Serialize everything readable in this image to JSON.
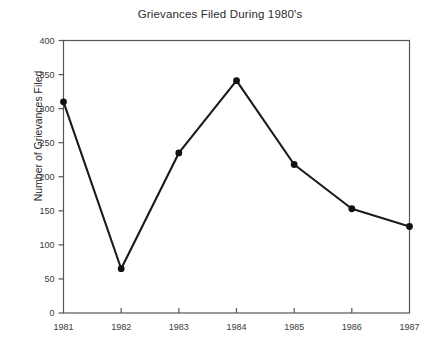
{
  "chart_data": {
    "type": "line",
    "title": "Grievances Filed During 1980's",
    "xlabel": "",
    "ylabel": "Number of Grievances Filed",
    "categories": [
      "1981",
      "1982",
      "1983",
      "1984",
      "1985",
      "1986",
      "1987"
    ],
    "values": [
      310,
      65,
      235,
      341,
      218,
      153,
      127
    ],
    "x": [
      1981,
      1982,
      1983,
      1984,
      1985,
      1986,
      1987
    ],
    "xlim": [
      1981,
      1987
    ],
    "ylim": [
      0,
      400
    ],
    "ytick_labels": [
      "0",
      "50",
      "100",
      "150",
      "200",
      "250",
      "300",
      "350",
      "400"
    ],
    "ytick_values": [
      0,
      50,
      100,
      150,
      200,
      250,
      300,
      350,
      400
    ],
    "xtick_labels": [
      "1981",
      "1982",
      "1983",
      "1984",
      "1985",
      "1986",
      "1987"
    ],
    "grid": false,
    "legend": null,
    "series": [
      {
        "name": "Grievances Filed",
        "values": [
          310,
          65,
          235,
          341,
          218,
          153,
          127
        ],
        "line_color": "#1a1a1a",
        "marker": "circle",
        "marker_color": "#111111"
      }
    ],
    "frame_color": "#555555",
    "background_color": "#ffffff"
  }
}
